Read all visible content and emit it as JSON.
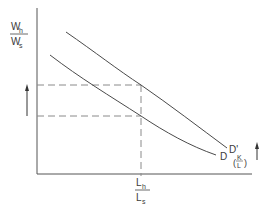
{
  "diagram": {
    "y_axis_label": {
      "numerator": "W",
      "numerator_sub": "h",
      "denominator": "W",
      "denominator_sub": "s"
    },
    "x_axis_label": {
      "numerator": "L",
      "numerator_sub": "h",
      "denominator": "L",
      "denominator_sub": "s"
    },
    "curves": [
      {
        "name": "D",
        "label": "D"
      },
      {
        "name": "D-prime",
        "label": "D'",
        "sublabel_num": "K",
        "sublabel_den": "L"
      }
    ],
    "colors": {
      "line": "#4a4a4a",
      "dash": "#8a8a8a",
      "text": "#3a3a3a"
    },
    "arrows": {
      "left": "up",
      "right": "up"
    }
  }
}
